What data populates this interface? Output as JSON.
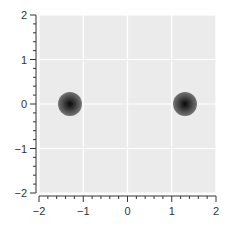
{
  "chart_data": {
    "type": "heatmap",
    "title": "",
    "xlabel": "",
    "ylabel": "",
    "xlim": [
      -2,
      2
    ],
    "ylim": [
      -2,
      2
    ],
    "xticks": [
      -2,
      -1,
      0,
      1,
      2
    ],
    "yticks": [
      -2,
      -1,
      0,
      1,
      2
    ],
    "xtick_labels": [
      "−2",
      "−1",
      "0",
      "1",
      "2"
    ],
    "ytick_labels": [
      "−2",
      "−1",
      "0",
      "1",
      "2"
    ],
    "minor_tick_step": 0.2,
    "grid": true,
    "legend": null,
    "peaks": [
      {
        "x": -1.3,
        "y": 0.0,
        "radius": 0.27
      },
      {
        "x": 1.3,
        "y": 0.0,
        "radius": 0.27
      }
    ],
    "contour_levels": 8,
    "colors": {
      "background": "#ebebeb",
      "grid": "#ffffff",
      "axis": "#333333",
      "contour_outer": "#6e6e6e",
      "contour_inner": "#111111"
    }
  }
}
